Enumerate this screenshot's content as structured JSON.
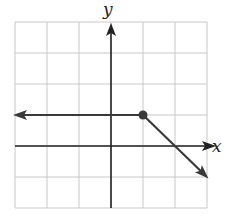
{
  "chart_data": {
    "type": "line",
    "title": "",
    "xlabel": "x",
    "ylabel": "y",
    "xlim": [
      -3,
      3
    ],
    "ylim": [
      -2,
      4
    ],
    "grid": true,
    "grid_step": 1,
    "tick_labels": false,
    "series": [
      {
        "name": "constant piece",
        "points": [
          [
            -3,
            1
          ],
          [
            1,
            1
          ]
        ],
        "description": "horizontal ray y = 1 for x <= 1, arrow pointing left"
      },
      {
        "name": "linear piece",
        "points": [
          [
            1,
            1
          ],
          [
            2,
            0
          ],
          [
            3,
            -1
          ]
        ],
        "description": "ray y = -x + 2 for x >= 1, arrow pointing down-right"
      }
    ],
    "annotations": [
      {
        "type": "closed-dot",
        "x": 1,
        "y": 1
      }
    ]
  },
  "axes": {
    "x_label": "x",
    "y_label": "y"
  },
  "colors": {
    "grid": "#c8c8c8",
    "axis": "#222222",
    "curve": "#3a3a3a"
  }
}
